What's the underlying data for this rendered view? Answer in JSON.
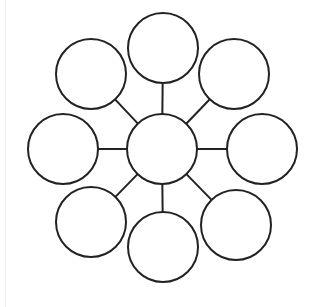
{
  "diagram": {
    "type": "bubble-map",
    "stroke_color": "#222222",
    "fill_color": "#ffffff",
    "stroke_width": 2,
    "center": {
      "name": "center-node",
      "cx": 162,
      "cy": 149,
      "r": 35,
      "label": ""
    },
    "nodes": [
      {
        "name": "node-top",
        "cx": 163,
        "cy": 48,
        "r": 35,
        "label": ""
      },
      {
        "name": "node-top-right",
        "cx": 234,
        "cy": 74,
        "r": 35,
        "label": ""
      },
      {
        "name": "node-right",
        "cx": 262,
        "cy": 149,
        "r": 35,
        "label": ""
      },
      {
        "name": "node-bottom-right",
        "cx": 236,
        "cy": 225,
        "r": 35,
        "label": ""
      },
      {
        "name": "node-bottom",
        "cx": 163,
        "cy": 247,
        "r": 35,
        "label": ""
      },
      {
        "name": "node-bottom-left",
        "cx": 91,
        "cy": 222,
        "r": 35,
        "label": ""
      },
      {
        "name": "node-left",
        "cx": 63,
        "cy": 149,
        "r": 35,
        "label": ""
      },
      {
        "name": "node-top-left",
        "cx": 91,
        "cy": 74,
        "r": 35,
        "label": ""
      }
    ]
  }
}
